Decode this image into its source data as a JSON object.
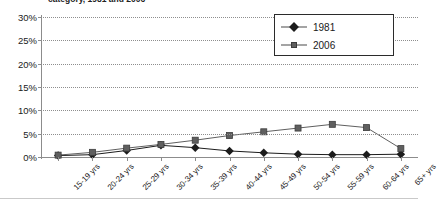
{
  "title": "category, 1981 and 2006",
  "legend": {
    "position": "top-right",
    "entries": [
      {
        "label": "1981",
        "marker": "diamond-marker",
        "color": "#1c1c1c"
      },
      {
        "label": "2006",
        "marker": "square-marker",
        "color": "#5f5f5f"
      }
    ]
  },
  "axes": {
    "y_ticks": [
      "0%",
      "5%",
      "10%",
      "15%",
      "20%",
      "25%",
      "30%"
    ],
    "y_values": [
      0,
      5,
      10,
      15,
      20,
      25,
      30
    ]
  },
  "chart_data": {
    "type": "line",
    "title": "category, 1981 and 2006",
    "xlabel": "",
    "ylabel": "",
    "ylim": [
      0,
      30
    ],
    "ytick_format": "percent",
    "grid": true,
    "legend_position": "top-right",
    "categories": [
      "15-19 yrs",
      "20-24 yrs",
      "25-29 yrs",
      "30-34 yrs",
      "35-39 yrs",
      "40-44 yrs",
      "45-49 yrs",
      "50-54 yrs",
      "55-59 yrs",
      "60-64 yrs",
      "65+ yrs"
    ],
    "series": [
      {
        "name": "1981",
        "marker": "diamond",
        "color": "#1c1c1c",
        "values": [
          0.3,
          0.5,
          1.4,
          2.5,
          2.0,
          1.3,
          0.9,
          0.6,
          0.5,
          0.5,
          0.6
        ]
      },
      {
        "name": "2006",
        "marker": "square",
        "color": "#5f5f5f",
        "values": [
          0.4,
          1.0,
          1.9,
          2.7,
          3.6,
          4.6,
          5.4,
          6.2,
          7.0,
          6.3,
          1.8
        ]
      }
    ]
  }
}
